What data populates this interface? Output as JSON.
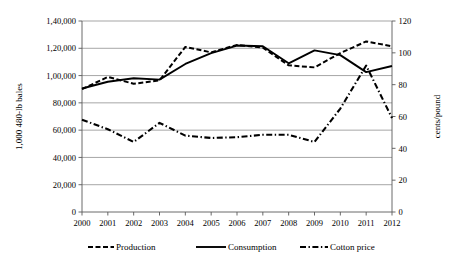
{
  "chart_data": {
    "type": "line",
    "title": "",
    "xlabel": "",
    "ylabel": "1,000 480-lb bales",
    "y2label": "cents/pound",
    "grid": true,
    "legend_position": "bottom",
    "x": [
      2000,
      2001,
      2002,
      2003,
      2004,
      2005,
      2006,
      2007,
      2008,
      2009,
      2010,
      2011,
      2012
    ],
    "categories": [
      "2000",
      "2001",
      "2002",
      "2003",
      "2004",
      "2005",
      "2006",
      "2007",
      "2008",
      "2009",
      "2010",
      "2011",
      "2012"
    ],
    "ylim": [
      0,
      140000
    ],
    "yticks": [
      0,
      20000,
      40000,
      60000,
      80000,
      100000,
      120000,
      140000
    ],
    "ytick_labels": [
      "0",
      "20,000",
      "40,000",
      "60,000",
      "80,000",
      "1,00,000",
      "1,20,000",
      "1,40,000"
    ],
    "y2lim": [
      0,
      120
    ],
    "y2ticks": [
      0,
      20,
      40,
      60,
      80,
      100,
      120
    ],
    "y2tick_labels": [
      "0",
      "20",
      "40",
      "60",
      "80",
      "100",
      "120"
    ],
    "series": [
      {
        "name": "Production",
        "axis": "left",
        "style": "dashed",
        "values": [
          90000,
          99000,
          94000,
          96500,
          121000,
          117000,
          122500,
          120500,
          107500,
          106000,
          116500,
          125000,
          121500
        ]
      },
      {
        "name": "Consumption",
        "axis": "left",
        "style": "solid",
        "values": [
          90500,
          95500,
          98000,
          97000,
          108500,
          116500,
          122000,
          121500,
          109000,
          118500,
          115000,
          102500,
          107000
        ]
      },
      {
        "name": "Cotton price",
        "axis": "right",
        "style": "dash-dot",
        "values": [
          58,
          52,
          44,
          56,
          48,
          46.5,
          47,
          48.5,
          48.5,
          44,
          65,
          92,
          59
        ]
      }
    ]
  },
  "legend": {
    "items": [
      {
        "label": "Production",
        "style": "dashed"
      },
      {
        "label": "Consumption",
        "style": "solid"
      },
      {
        "label": "Cotton price",
        "style": "dash-dot"
      }
    ]
  },
  "colors": {
    "line": "#000000",
    "grid": "#808080",
    "axis": "#595959",
    "background": "#ffffff"
  }
}
